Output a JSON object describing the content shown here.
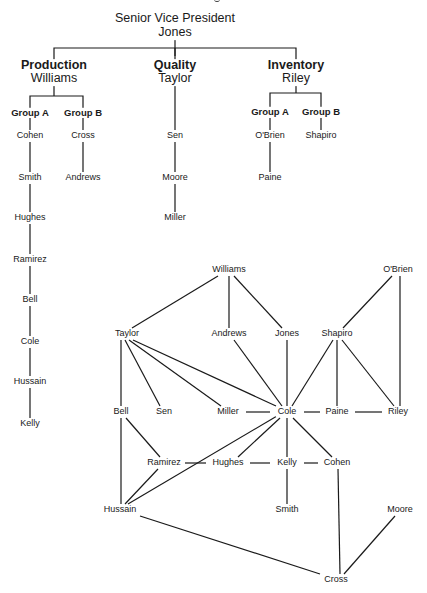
{
  "org_chart": {
    "root": {
      "title": "Senior Vice President",
      "name": "Jones"
    },
    "divisions": [
      {
        "title": "Production",
        "head": "Williams",
        "groups": [
          {
            "label": "Group A",
            "members": [
              "Cohen",
              "Smith",
              "Hughes",
              "Ramirez",
              "Bell",
              "Cole",
              "Hussain",
              "Kelly"
            ]
          },
          {
            "label": "Group B",
            "members": [
              "Cross",
              "Andrews"
            ]
          }
        ]
      },
      {
        "title": "Quality",
        "head": "Taylor",
        "groups": [
          {
            "label": "",
            "members": [
              "Sen",
              "Moore",
              "Miller"
            ]
          }
        ]
      },
      {
        "title": "Inventory",
        "head": "Riley",
        "groups": [
          {
            "label": "Group A",
            "members": [
              "O'Brien",
              "Paine"
            ]
          },
          {
            "label": "Group B",
            "members": [
              "Shapiro"
            ]
          }
        ]
      }
    ]
  },
  "network": {
    "nodes": [
      {
        "id": "Williams",
        "x": 229,
        "y": 270
      },
      {
        "id": "O'Brien",
        "x": 398,
        "y": 270
      },
      {
        "id": "Taylor",
        "x": 127,
        "y": 334
      },
      {
        "id": "Andrews",
        "x": 229,
        "y": 334
      },
      {
        "id": "Jones",
        "x": 287,
        "y": 334
      },
      {
        "id": "Shapiro",
        "x": 337,
        "y": 334
      },
      {
        "id": "Bell",
        "x": 121,
        "y": 412
      },
      {
        "id": "Sen",
        "x": 164,
        "y": 412
      },
      {
        "id": "Miller",
        "x": 228,
        "y": 412
      },
      {
        "id": "Cole",
        "x": 287,
        "y": 412
      },
      {
        "id": "Paine",
        "x": 337,
        "y": 412
      },
      {
        "id": "Riley",
        "x": 398,
        "y": 412
      },
      {
        "id": "Ramirez",
        "x": 164,
        "y": 463
      },
      {
        "id": "Hughes",
        "x": 228,
        "y": 463
      },
      {
        "id": "Kelly",
        "x": 287,
        "y": 463
      },
      {
        "id": "Cohen",
        "x": 337,
        "y": 463
      },
      {
        "id": "Hussain",
        "x": 120,
        "y": 510
      },
      {
        "id": "Smith",
        "x": 287,
        "y": 510
      },
      {
        "id": "Moore",
        "x": 400,
        "y": 510
      },
      {
        "id": "Cross",
        "x": 336,
        "y": 580
      }
    ],
    "edges": [
      [
        "Williams",
        "Taylor"
      ],
      [
        "Williams",
        "Andrews"
      ],
      [
        "Williams",
        "Jones"
      ],
      [
        "O'Brien",
        "Shapiro"
      ],
      [
        "O'Brien",
        "Riley"
      ],
      [
        "Taylor",
        "Bell"
      ],
      [
        "Taylor",
        "Sen"
      ],
      [
        "Taylor",
        "Miller"
      ],
      [
        "Taylor",
        "Cole"
      ],
      [
        "Andrews",
        "Cole"
      ],
      [
        "Jones",
        "Cole"
      ],
      [
        "Shapiro",
        "Cole"
      ],
      [
        "Shapiro",
        "Paine"
      ],
      [
        "Shapiro",
        "Riley"
      ],
      [
        "Miller",
        "Cole"
      ],
      [
        "Cole",
        "Paine"
      ],
      [
        "Paine",
        "Riley"
      ],
      [
        "Bell",
        "Ramirez"
      ],
      [
        "Bell",
        "Hussain"
      ],
      [
        "Cole",
        "Hughes"
      ],
      [
        "Cole",
        "Hussain"
      ],
      [
        "Cole",
        "Kelly"
      ],
      [
        "Cole",
        "Cohen"
      ],
      [
        "Ramirez",
        "Hughes"
      ],
      [
        "Hughes",
        "Kelly"
      ],
      [
        "Kelly",
        "Cohen"
      ],
      [
        "Ramirez",
        "Hussain"
      ],
      [
        "Kelly",
        "Smith"
      ],
      [
        "Hussain",
        "Cross"
      ],
      [
        "Cohen",
        "Cross"
      ],
      [
        "Moore",
        "Cross"
      ]
    ]
  }
}
